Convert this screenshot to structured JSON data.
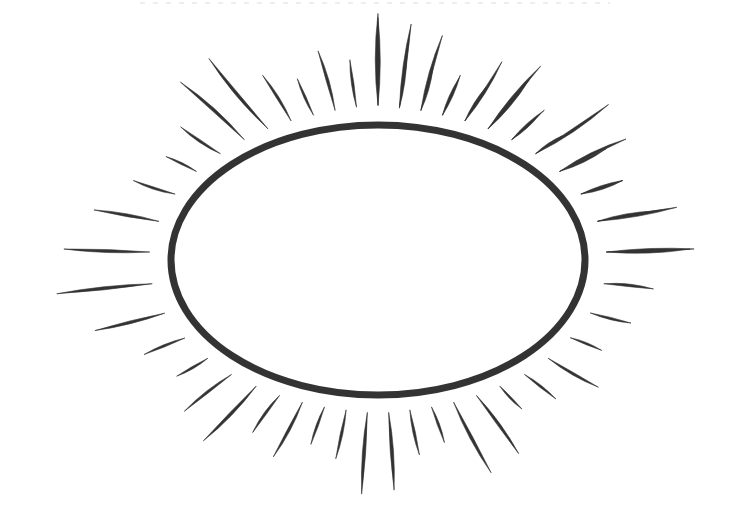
{
  "canvas": {
    "width": 750,
    "height": 529,
    "background_color": "#ffffff",
    "ink_color": "#333333",
    "title": "Sun Burst Line Drawing",
    "medium": "hand-drawn ink line art"
  },
  "artwork": {
    "name": "sun-burst",
    "description": "Hand-drawn sun symbol: a single elliptical outline surrounded by a ring of tapered radial ray strokes",
    "center": {
      "x": 378,
      "y": 260
    }
  },
  "ellipse": {
    "name": "sun-body-ellipse",
    "cx": 378,
    "cy": 260,
    "rx": 207,
    "ry": 135,
    "stroke_color": "#333333",
    "stroke_width": 7,
    "fill": "none"
  },
  "rays": {
    "count": 44,
    "stroke_color": "#333333",
    "style": "tapered spindle, pointed at both ends",
    "gap_from_ellipse": 12,
    "items": [
      {
        "angle": -90,
        "gap": 16,
        "length": 92,
        "width": 7.0,
        "bow": 2
      },
      {
        "angle": -82,
        "gap": 14,
        "length": 54,
        "width": 5.0,
        "bow": 1
      },
      {
        "angle": -74,
        "gap": 14,
        "length": 78,
        "width": 6.0,
        "bow": 2
      },
      {
        "angle": -66,
        "gap": 13,
        "length": 44,
        "width": 4.5,
        "bow": 1
      },
      {
        "angle": -58,
        "gap": 13,
        "length": 40,
        "width": 4.5,
        "bow": 1
      },
      {
        "angle": -50,
        "gap": 13,
        "length": 64,
        "width": 5.5,
        "bow": 2
      },
      {
        "angle": -42,
        "gap": 13,
        "length": 44,
        "width": 4.5,
        "bow": 1
      },
      {
        "angle": -34,
        "gap": 13,
        "length": 88,
        "width": 6.0,
        "bow": 3
      },
      {
        "angle": -26,
        "gap": 14,
        "length": 74,
        "width": 5.5,
        "bow": 3
      },
      {
        "angle": -18,
        "gap": 15,
        "length": 44,
        "width": 4.5,
        "bow": 2
      },
      {
        "angle": -10,
        "gap": 16,
        "length": 60,
        "width": 5.0,
        "bow": 2
      },
      {
        "angle": -2,
        "gap": 18,
        "length": 84,
        "width": 6.0,
        "bow": 2
      },
      {
        "angle": 6,
        "gap": 18,
        "length": 50,
        "width": 5.0,
        "bow": 2
      },
      {
        "angle": 14,
        "gap": 16,
        "length": 42,
        "width": 4.5,
        "bow": 1
      },
      {
        "angle": 22,
        "gap": 14,
        "length": 34,
        "width": 4.0,
        "bow": 1
      },
      {
        "angle": 30,
        "gap": 14,
        "length": 58,
        "width": 5.0,
        "bow": 2
      },
      {
        "angle": 38,
        "gap": 14,
        "length": 40,
        "width": 4.5,
        "bow": 1
      },
      {
        "angle": 46,
        "gap": 13,
        "length": 32,
        "width": 4.0,
        "bow": 1
      },
      {
        "angle": 54,
        "gap": 13,
        "length": 72,
        "width": 5.5,
        "bow": 2
      },
      {
        "angle": 62,
        "gap": 13,
        "length": 80,
        "width": 6.0,
        "bow": 2
      },
      {
        "angle": 70,
        "gap": 13,
        "length": 38,
        "width": 4.5,
        "bow": 1
      },
      {
        "angle": 78,
        "gap": 13,
        "length": 46,
        "width": 5.0,
        "bow": 1
      },
      {
        "angle": 86,
        "gap": 14,
        "length": 78,
        "width": 6.5,
        "bow": 1
      },
      {
        "angle": 94,
        "gap": 14,
        "length": 82,
        "width": 6.5,
        "bow": 1
      },
      {
        "angle": 102,
        "gap": 13,
        "length": 50,
        "width": 5.0,
        "bow": 1
      },
      {
        "angle": 110,
        "gap": 13,
        "length": 40,
        "width": 4.5,
        "bow": 1
      },
      {
        "angle": 118,
        "gap": 13,
        "length": 62,
        "width": 5.5,
        "bow": 2
      },
      {
        "angle": 126,
        "gap": 13,
        "length": 46,
        "width": 5.0,
        "bow": 2
      },
      {
        "angle": 134,
        "gap": 13,
        "length": 76,
        "width": 6.0,
        "bow": 2
      },
      {
        "angle": 142,
        "gap": 14,
        "length": 60,
        "width": 5.0,
        "bow": 2
      },
      {
        "angle": 150,
        "gap": 14,
        "length": 36,
        "width": 4.5,
        "bow": 1
      },
      {
        "angle": 158,
        "gap": 15,
        "length": 44,
        "width": 4.5,
        "bow": 1
      },
      {
        "angle": 166,
        "gap": 17,
        "length": 72,
        "width": 5.5,
        "bow": 1
      },
      {
        "angle": 174,
        "gap": 18,
        "length": 96,
        "width": 6.0,
        "bow": 1
      },
      {
        "angle": 182,
        "gap": 18,
        "length": 86,
        "width": 6.0,
        "bow": 1
      },
      {
        "angle": 190,
        "gap": 16,
        "length": 66,
        "width": 5.5,
        "bow": 1
      },
      {
        "angle": 198,
        "gap": 15,
        "length": 44,
        "width": 4.5,
        "bow": 2
      },
      {
        "angle": 206,
        "gap": 14,
        "length": 34,
        "width": 4.0,
        "bow": 1
      },
      {
        "angle": 214,
        "gap": 13,
        "length": 48,
        "width": 5.0,
        "bow": 2
      },
      {
        "angle": 222,
        "gap": 13,
        "length": 86,
        "width": 6.0,
        "bow": 3
      },
      {
        "angle": 230,
        "gap": 13,
        "length": 92,
        "width": 6.0,
        "bow": 3
      },
      {
        "angle": 238,
        "gap": 13,
        "length": 54,
        "width": 5.0,
        "bow": 2
      },
      {
        "angle": 246,
        "gap": 13,
        "length": 40,
        "width": 4.5,
        "bow": 1
      },
      {
        "angle": 254,
        "gap": 14,
        "length": 62,
        "width": 5.5,
        "bow": 2
      },
      {
        "angle": 262,
        "gap": 15,
        "length": 48,
        "width": 5.0,
        "bow": 1
      },
      {
        "angle": 270,
        "gap": 16,
        "length": 88,
        "width": 7.0,
        "bow": 1
      },
      {
        "angle": 278,
        "gap": 15,
        "length": 84,
        "width": 6.5,
        "bow": 1
      },
      {
        "angle": 286,
        "gap": 14,
        "length": 44,
        "width": 5.0,
        "bow": 1
      },
      {
        "angle": 294,
        "gap": 13,
        "length": 40,
        "width": 4.5,
        "bow": 1
      },
      {
        "angle": 302,
        "gap": 13,
        "length": 70,
        "width": 5.5,
        "bow": 2
      },
      {
        "angle": 310,
        "gap": 13,
        "length": 82,
        "width": 6.0,
        "bow": 2
      },
      {
        "angle": 318,
        "gap": 13,
        "length": 38,
        "width": 4.5,
        "bow": 1
      },
      {
        "angle": 326,
        "gap": 13,
        "length": 32,
        "width": 4.0,
        "bow": 1
      },
      {
        "angle": 334,
        "gap": 14,
        "length": 52,
        "width": 5.0,
        "bow": 2
      },
      {
        "angle": 342,
        "gap": 15,
        "length": 44,
        "width": 4.5,
        "bow": 1
      },
      {
        "angle": 350,
        "gap": 17,
        "length": 80,
        "width": 6.0,
        "bow": 1
      },
      {
        "angle": 358,
        "gap": 18,
        "length": 88,
        "width": 6.0,
        "bow": 1
      }
    ]
  },
  "artifacts": {
    "top_scan_line": {
      "name": "scan-artifact-line",
      "visible": true,
      "note": "faint dotted grey line near top edge"
    }
  }
}
